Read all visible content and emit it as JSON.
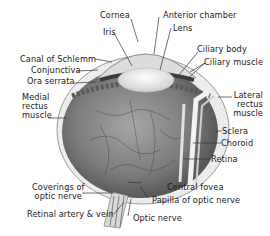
{
  "diagram": {
    "colors": {
      "background": "#ffffff",
      "text": "#1a1a1a",
      "leader_lines": "#333333",
      "eyeball_fill": "#8a8a8a",
      "eyeball_dark": "#5e5e5e",
      "sclera": "#e6e6e6",
      "lens": "#f4f4f4"
    },
    "labels": {
      "cornea": "Cornea",
      "anterior_chamber": "Anterior chamber",
      "iris": "Iris",
      "lens": "Lens",
      "canal_of_schlemm": "Canal of Schlemm",
      "ciliary_body": "Ciliary body",
      "conjunctiva": "Conjunctiva",
      "ciliary_muscle": "Ciliary muscle",
      "ora_serrata": "Ora serrata",
      "medial_rectus_1": "Medial",
      "medial_rectus_2": "rectus",
      "medial_rectus_3": "muscle",
      "lateral_rectus_1": "Lateral",
      "lateral_rectus_2": "rectus",
      "lateral_rectus_3": "muscle",
      "sclera": "Sclera",
      "choroid": "Choroid",
      "retina": "Retina",
      "coverings_1": "Coverings of",
      "coverings_2": "optic nerve",
      "central_fovea": "Central fovea",
      "papilla": "Papilla of optic nerve",
      "retinal_artery_vein": "Retinal artery & vein",
      "optic_nerve": "Optic nerve"
    }
  }
}
